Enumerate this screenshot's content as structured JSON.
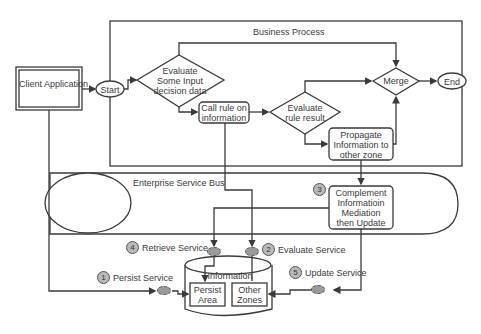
{
  "diagram": {
    "title": "Business Process",
    "bus_label": "Enterprise Service Bus",
    "client": "Client Application",
    "nodes": {
      "start": "Start",
      "end": "End",
      "evaluate_input": [
        "Evaluate",
        "Some Input",
        "decision data"
      ],
      "call_rule": [
        "Call rule on",
        "information"
      ],
      "evaluate_rule": [
        "Evaluate",
        "rule result"
      ],
      "merge": "Merge",
      "propagate": [
        "Propagate",
        "Information to",
        "other zone"
      ],
      "complement": [
        "Complement",
        "Informatioin",
        "Mediation",
        "then Update"
      ]
    },
    "store": {
      "label": "Information",
      "persist_area": [
        "Persist",
        "Area"
      ],
      "other_zones": [
        "Other",
        "Zones"
      ]
    },
    "services": [
      {
        "num": "1",
        "label": "Persist Service"
      },
      {
        "num": "2",
        "label": "Evaluate Service"
      },
      {
        "num": "3",
        "label": ""
      },
      {
        "num": "4",
        "label": "Retrieve Service"
      },
      {
        "num": "5",
        "label": "Update Service"
      }
    ]
  }
}
